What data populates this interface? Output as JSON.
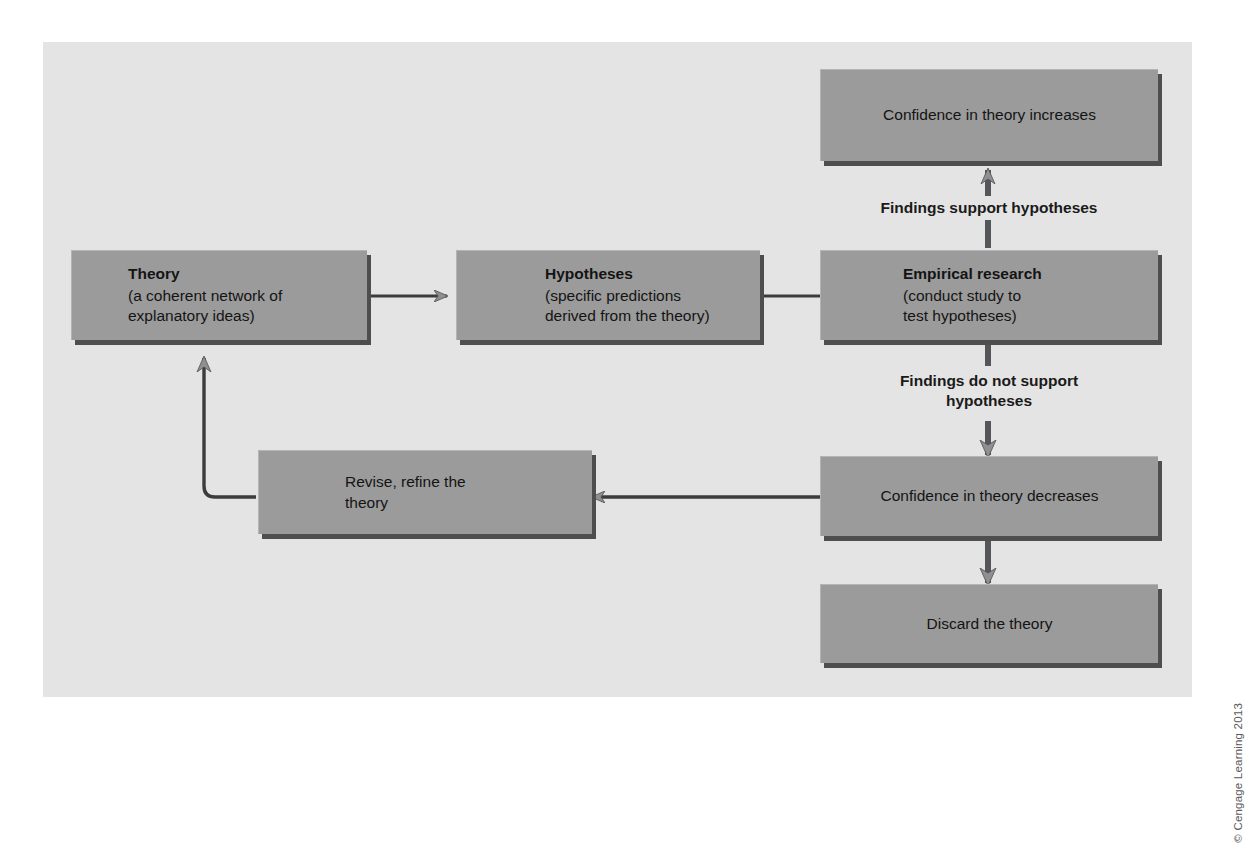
{
  "figure": {
    "credit": "© Cengage Learning 2013",
    "panel_color": "#e4e4e4",
    "box_color": "#9b9b9b",
    "shadow_color": "#4e4e4e",
    "arrow_color": "#6f6f6f",
    "text_color": "#141414"
  },
  "nodes": {
    "theory": {
      "title": "Theory",
      "line1": "(a coherent network of",
      "line2": "explanatory ideas)"
    },
    "hypotheses": {
      "title": "Hypotheses",
      "line1": "(specific predictions",
      "line2": "derived from the theory)"
    },
    "empirical_research": {
      "title": "Empirical research",
      "line1": "(conduct study to",
      "line2": "test hypotheses)"
    },
    "confidence_increases": {
      "label": "Confidence in theory increases"
    },
    "confidence_decreases": {
      "label": "Confidence in theory decreases"
    },
    "discard": {
      "label": "Discard the theory"
    },
    "revise": {
      "line1": "Revise, refine the",
      "line2": "theory"
    }
  },
  "edge_labels": {
    "support": "Findings support hypotheses",
    "not_support_line1": "Findings do not support",
    "not_support_line2": "hypotheses"
  }
}
